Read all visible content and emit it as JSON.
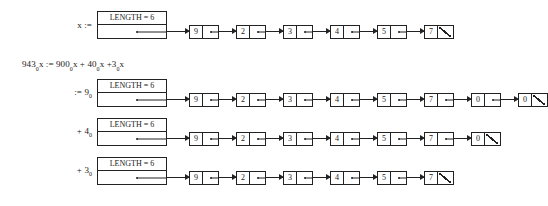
{
  "figure": {
    "header_label": "LENGTH = 6",
    "null_marker": "slash",
    "colors": {
      "ink": "#222222",
      "background": "#ffffff"
    },
    "equation": {
      "line": "943",
      "sub1": "0",
      "part2": "x := 900",
      "sub2": "0",
      "part3": "x + 40",
      "sub3": "0",
      "part4": "x +3",
      "sub4": "0",
      "part5": "x"
    },
    "rows": [
      {
        "label_main": "x :=",
        "label_sub": "",
        "header": "LENGTH = 6",
        "nodes": [
          {
            "value": "9",
            "next": "pointer"
          },
          {
            "value": "2",
            "next": "pointer"
          },
          {
            "value": "3",
            "next": "pointer"
          },
          {
            "value": "4",
            "next": "pointer"
          },
          {
            "value": "5",
            "next": "pointer"
          },
          {
            "value": "7",
            "next": "null"
          }
        ]
      },
      {
        "label_main": ":= 9",
        "label_sub": "0",
        "header": "LENGTH = 6",
        "nodes": [
          {
            "value": "9",
            "next": "pointer"
          },
          {
            "value": "2",
            "next": "pointer"
          },
          {
            "value": "3",
            "next": "pointer"
          },
          {
            "value": "4",
            "next": "pointer"
          },
          {
            "value": "5",
            "next": "pointer"
          },
          {
            "value": "7",
            "next": "pointer"
          },
          {
            "value": "0",
            "next": "pointer"
          },
          {
            "value": "0",
            "next": "null"
          }
        ]
      },
      {
        "label_main": "+ 4",
        "label_sub": "0",
        "header": "LENGTH = 6",
        "nodes": [
          {
            "value": "9",
            "next": "pointer"
          },
          {
            "value": "2",
            "next": "pointer"
          },
          {
            "value": "3",
            "next": "pointer"
          },
          {
            "value": "4",
            "next": "pointer"
          },
          {
            "value": "5",
            "next": "pointer"
          },
          {
            "value": "7",
            "next": "pointer"
          },
          {
            "value": "0",
            "next": "null"
          }
        ]
      },
      {
        "label_main": "+ 3",
        "label_sub": "0",
        "header": "LENGTH = 6",
        "nodes": [
          {
            "value": "9",
            "next": "pointer"
          },
          {
            "value": "2",
            "next": "pointer"
          },
          {
            "value": "3",
            "next": "pointer"
          },
          {
            "value": "4",
            "next": "pointer"
          },
          {
            "value": "5",
            "next": "pointer"
          },
          {
            "value": "7",
            "next": "null"
          }
        ]
      }
    ]
  }
}
